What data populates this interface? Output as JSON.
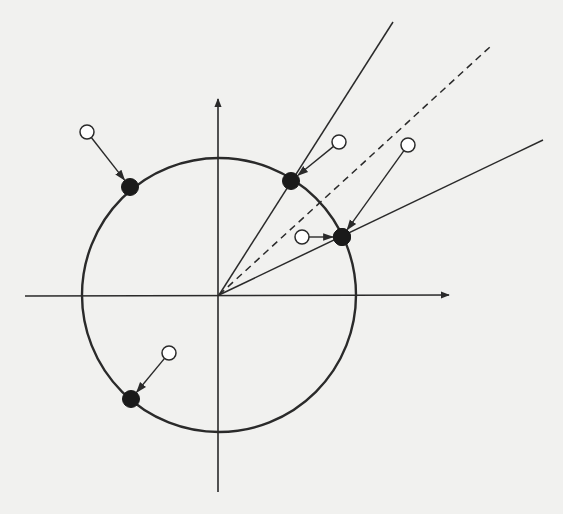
{
  "diagram": {
    "title": "",
    "background": "#f1f1ef",
    "stroke_color": "#2a2a2a",
    "origin": [
      219,
      296
    ],
    "axes": {
      "x": {
        "from": [
          25,
          296
        ],
        "to": [
          449,
          295
        ],
        "arrow": true
      },
      "y": {
        "from": [
          218,
          492
        ],
        "to": [
          218,
          99
        ],
        "arrow": true
      }
    },
    "circle": {
      "cx": 219,
      "cy": 295,
      "r": 137
    },
    "rays": [
      {
        "name": "upper-boundary-ray",
        "to": [
          393,
          22
        ],
        "style": "solid"
      },
      {
        "name": "center-ray",
        "to": [
          491,
          46
        ],
        "style": "dashed"
      },
      {
        "name": "lower-boundary-ray",
        "to": [
          543,
          140
        ],
        "style": "solid"
      }
    ],
    "projections": [
      {
        "name": "projection-1",
        "open": [
          87,
          132
        ],
        "filled": [
          130,
          187
        ]
      },
      {
        "name": "projection-2",
        "open": [
          339,
          142
        ],
        "filled": [
          291,
          181
        ]
      },
      {
        "name": "projection-3",
        "open": [
          408,
          145
        ],
        "filled": [
          342,
          237
        ]
      },
      {
        "name": "projection-4",
        "open": [
          302,
          237
        ],
        "filled": [
          342,
          237
        ]
      },
      {
        "name": "projection-5",
        "open": [
          169,
          353
        ],
        "filled": [
          131,
          399
        ]
      }
    ],
    "open_point_radius": 7,
    "filled_point_radius": 8.5
  }
}
